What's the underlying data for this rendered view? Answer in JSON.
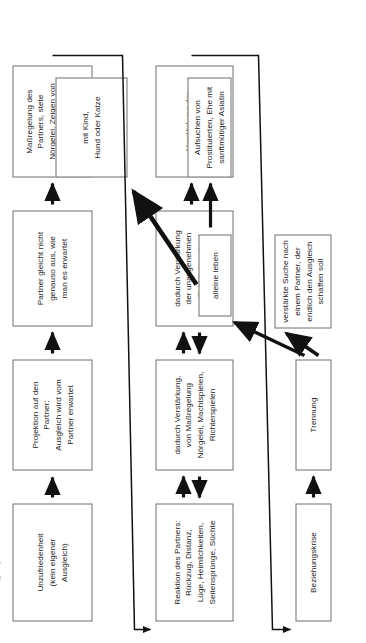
{
  "diagram": {
    "language": "de",
    "type": "flowchart",
    "title_partial": "Beziehungsdynamik",
    "orientation": "rotated-90-ccw",
    "colors": {
      "box_border": "#6f6f6f",
      "box_fill": "#ffffff",
      "arrow": "#111111",
      "text": "#1b1b1b",
      "background": "#ffffff"
    }
  },
  "rows": {
    "row1": {
      "name": "eigene-projektion",
      "boxes": [
        {
          "id": "r1b1",
          "label": "Unzufriedenheit\n(kein eigener\nAusgleich)"
        },
        {
          "id": "r1b2",
          "label": "Projektion auf den\nPartner:\nAusgleich wird vom\nPartner erwartet"
        },
        {
          "id": "r1b3",
          "label": "Partner gleicht nicht\ngenauso aus, wie\nman es erwartet"
        },
        {
          "id": "r1b4",
          "label": "Maßregelung des\nPartners, stete\nNörgelei, Zeigen von\nErsatzgefühlen\n(Ärger, Wut etc.)"
        }
      ]
    },
    "row2": {
      "name": "partner-reaktion",
      "boxes": [
        {
          "id": "r2b1",
          "label": "Reaktion des Partners:\nRückzug, Distanz,\nLüge, Heimlichkeiten,\nSeitensprünge, Süchte"
        },
        {
          "id": "r2b2",
          "label": "dadurch Verstärkung,\nvon Maßregelung\nNörgelei, Machtspielen,\nRichterspielen"
        },
        {
          "id": "r2b3",
          "label": "dadurch Verstärkung\nder unangenehmen\nReaktionen des\nPartners"
        },
        {
          "id": "r2b4",
          "label": "Verstärkung der\nUnzufriedenheit"
        }
      ]
    },
    "row3": {
      "name": "krise-und-folgen",
      "boxes": [
        {
          "id": "r3b1",
          "label": "Beziehungskrise"
        },
        {
          "id": "r3b2",
          "label": "Trennung"
        }
      ]
    },
    "outcomes": {
      "name": "trennungs-folgen",
      "boxes": [
        {
          "id": "o1",
          "label": "verstärkte Suche nach\neinem Partner, der\nendlich den Ausgleich\nschaffen soll"
        },
        {
          "id": "o2",
          "label": "alleine leben"
        },
        {
          "id": "o3",
          "label": "Aufsuchen von\nProstituierten, Ehe mit\nsanftmütiger Asiatin"
        },
        {
          "id": "o4",
          "label": "mit Kind,\nHund oder Katze"
        }
      ]
    }
  },
  "connectors": [
    {
      "id": "a1",
      "name": "arrow-unzufriedenheit-to-projektion",
      "kind": "single-up"
    },
    {
      "id": "a2",
      "name": "arrow-projektion-to-partner-gleicht-nicht",
      "kind": "single-up"
    },
    {
      "id": "a3",
      "name": "arrow-partner-gleicht-nicht-to-massregelung",
      "kind": "single-up"
    },
    {
      "id": "a4",
      "name": "arrow-pair-reaktion-verstaerkung",
      "kind": "double-up-down"
    },
    {
      "id": "a5",
      "name": "arrow-pair-verstaerkung-reaktionen",
      "kind": "double-up-down"
    },
    {
      "id": "a6",
      "name": "arrow-reaktionen-to-verstaerkung-unzufriedenheit",
      "kind": "single-up"
    },
    {
      "id": "a7",
      "name": "arrow-beziehungskrise-to-trennung",
      "kind": "single-up"
    },
    {
      "id": "a8",
      "name": "arrow-alleine-leben-to-prostituierte",
      "kind": "single-right-short"
    },
    {
      "id": "a9",
      "name": "feedback-line-massregelung-to-reaktion",
      "kind": "long-feedback"
    },
    {
      "id": "a10",
      "name": "feedback-line-verstaerkung-to-beziehungskrise",
      "kind": "long-feedback"
    },
    {
      "id": "a11",
      "name": "branch-trennung-to-alleine-leben",
      "kind": "branch"
    },
    {
      "id": "a12",
      "name": "branch-trennung-to-verstaerkte-suche",
      "kind": "branch"
    },
    {
      "id": "a13",
      "name": "arrow-alleine-leben-to-mit-kind",
      "kind": "thick-diagonal"
    }
  ]
}
